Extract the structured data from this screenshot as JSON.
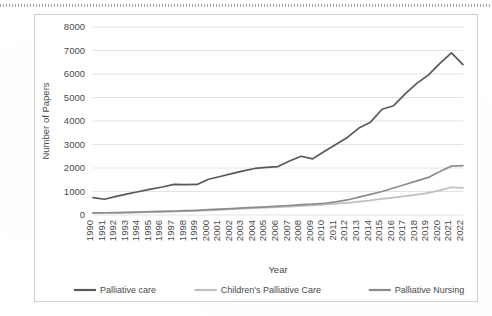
{
  "chart_data": {
    "type": "line",
    "title": "",
    "xlabel": "Year",
    "ylabel": "Number of Papers",
    "ylim": [
      0,
      8000
    ],
    "ytick_step": 1000,
    "yticks": [
      "0",
      "1000",
      "2000",
      "3000",
      "4000",
      "5000",
      "6000",
      "7000",
      "8000"
    ],
    "grid": "horizontal",
    "legend_position": "bottom",
    "categories": [
      "1990",
      "1991",
      "1992",
      "1993",
      "1994",
      "1995",
      "1996",
      "1997",
      "1998",
      "1999",
      "2000",
      "2001",
      "2002",
      "2003",
      "2004",
      "2005",
      "2006",
      "2007",
      "2008",
      "2009",
      "2010",
      "2011",
      "2012",
      "2013",
      "2014",
      "2015",
      "2016",
      "2017",
      "2018",
      "2019",
      "2020",
      "2021",
      "2022"
    ],
    "series": [
      {
        "name": "Palliative care",
        "color": "#595959",
        "values": [
          740,
          670,
          790,
          900,
          1000,
          1100,
          1190,
          1300,
          1290,
          1300,
          1520,
          1640,
          1760,
          1880,
          1980,
          2030,
          2060,
          2300,
          2500,
          2390,
          2700,
          3000,
          3300,
          3700,
          3950,
          4500,
          4650,
          5150,
          5600,
          5950,
          6450,
          6900,
          6400
        ]
      },
      {
        "name": "Children's Palliative Care",
        "color": "#bfbfbf",
        "values": [
          80,
          85,
          90,
          100,
          110,
          120,
          130,
          145,
          160,
          175,
          200,
          220,
          245,
          270,
          290,
          310,
          330,
          360,
          390,
          410,
          440,
          480,
          520,
          570,
          620,
          690,
          740,
          800,
          870,
          940,
          1050,
          1180,
          1150
        ]
      },
      {
        "name": "Palliative Nursing",
        "color": "#8c8c8c",
        "values": [
          90,
          95,
          105,
          115,
          125,
          140,
          155,
          170,
          185,
          200,
          225,
          250,
          275,
          300,
          325,
          350,
          375,
          405,
          440,
          460,
          500,
          560,
          640,
          760,
          880,
          1000,
          1150,
          1300,
          1450,
          1600,
          1850,
          2080,
          2100
        ]
      }
    ]
  },
  "legend": {
    "items": [
      {
        "label": "Palliative care",
        "color": "#595959"
      },
      {
        "label": "Children's Palliative Care",
        "color": "#bfbfbf"
      },
      {
        "label": "Palliative Nursing",
        "color": "#8c8c8c"
      }
    ]
  }
}
